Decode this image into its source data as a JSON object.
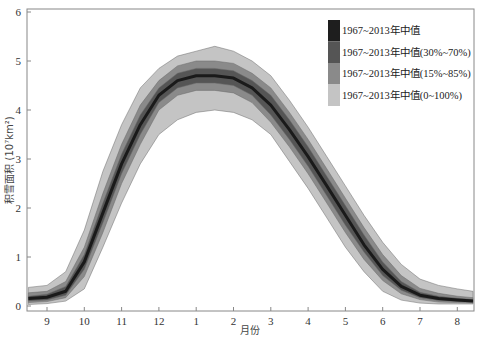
{
  "chart_data": {
    "type": "area",
    "title": "",
    "xlabel": "月份",
    "ylabel": "积雪面积 (10⁷km²)",
    "ylim": [
      0,
      6
    ],
    "xlim": [
      8.5,
      20.5
    ],
    "grid": false,
    "legend_position": "upper right (inside)",
    "x_ticks": [
      9,
      10,
      11,
      12,
      13,
      14,
      15,
      16,
      17,
      18,
      19,
      20
    ],
    "x_tick_labels": [
      "9",
      "10",
      "11",
      "12",
      "1",
      "2",
      "3",
      "4",
      "5",
      "6",
      "7",
      "8"
    ],
    "y_ticks": [
      0,
      1,
      2,
      3,
      4,
      5,
      6
    ],
    "y_tick_labels": [
      "0",
      "1",
      "2",
      "3",
      "4",
      "5",
      "6"
    ],
    "x": [
      8.5,
      9.0,
      9.5,
      10.0,
      10.5,
      11.0,
      11.5,
      12.0,
      12.5,
      13.0,
      13.5,
      14.0,
      14.5,
      15.0,
      15.5,
      16.0,
      16.5,
      17.0,
      17.5,
      18.0,
      18.5,
      19.0,
      19.5,
      20.0,
      20.5
    ],
    "series": [
      {
        "name": "1967~2013年中值",
        "type": "line",
        "color": "#1a1a1a",
        "values": [
          0.15,
          0.18,
          0.3,
          0.9,
          1.9,
          2.9,
          3.7,
          4.3,
          4.6,
          4.7,
          4.7,
          4.65,
          4.45,
          4.1,
          3.6,
          3.05,
          2.45,
          1.85,
          1.25,
          0.75,
          0.4,
          0.22,
          0.15,
          0.12,
          0.1
        ]
      },
      {
        "name": "1967~2013年中值(30%~70%)",
        "type": "band",
        "color": "#555555",
        "lower": [
          0.1,
          0.12,
          0.22,
          0.75,
          1.7,
          2.7,
          3.5,
          4.15,
          4.45,
          4.55,
          4.55,
          4.5,
          4.3,
          3.9,
          3.4,
          2.85,
          2.25,
          1.65,
          1.1,
          0.62,
          0.32,
          0.17,
          0.11,
          0.09,
          0.08
        ],
        "upper": [
          0.2,
          0.24,
          0.4,
          1.05,
          2.1,
          3.1,
          3.9,
          4.45,
          4.75,
          4.85,
          4.85,
          4.8,
          4.6,
          4.3,
          3.8,
          3.25,
          2.65,
          2.05,
          1.45,
          0.9,
          0.5,
          0.28,
          0.2,
          0.16,
          0.13
        ]
      },
      {
        "name": "1967~2013年中值(15%~85%)",
        "type": "band",
        "color": "#8a8a8a",
        "lower": [
          0.07,
          0.09,
          0.17,
          0.6,
          1.5,
          2.5,
          3.3,
          4.0,
          4.3,
          4.4,
          4.4,
          4.35,
          4.15,
          3.75,
          3.25,
          2.7,
          2.1,
          1.5,
          0.95,
          0.52,
          0.25,
          0.13,
          0.08,
          0.07,
          0.06
        ],
        "upper": [
          0.27,
          0.3,
          0.5,
          1.2,
          2.3,
          3.3,
          4.1,
          4.6,
          4.9,
          5.0,
          5.0,
          4.95,
          4.75,
          4.45,
          3.95,
          3.4,
          2.8,
          2.2,
          1.6,
          1.05,
          0.62,
          0.36,
          0.26,
          0.2,
          0.17
        ]
      },
      {
        "name": "1967~2013年中值(0~100%)",
        "type": "band",
        "color": "#c4c4c4",
        "lower": [
          0.03,
          0.05,
          0.1,
          0.35,
          1.2,
          2.1,
          2.9,
          3.5,
          3.8,
          3.95,
          4.0,
          3.95,
          3.8,
          3.5,
          2.95,
          2.4,
          1.8,
          1.2,
          0.7,
          0.3,
          0.12,
          0.06,
          0.04,
          0.04,
          0.04
        ],
        "upper": [
          0.38,
          0.42,
          0.7,
          1.55,
          2.75,
          3.7,
          4.45,
          4.85,
          5.1,
          5.2,
          5.3,
          5.2,
          5.0,
          4.7,
          4.2,
          3.65,
          3.05,
          2.45,
          1.85,
          1.3,
          0.85,
          0.55,
          0.42,
          0.35,
          0.3
        ]
      }
    ]
  },
  "legend": {
    "items": [
      {
        "label": "1967~2013年中值",
        "color": "#1e1e1e"
      },
      {
        "label": "1967~2013年中值(30%~70%)",
        "color": "#555555"
      },
      {
        "label": "1967~2013年中值(15%~85%)",
        "color": "#8a8a8a"
      },
      {
        "label": "1967~2013年中值(0~100%)",
        "color": "#c4c4c4"
      }
    ]
  },
  "axes": {
    "xlabel": "月份",
    "ylabel": "积雪面积 (10⁷km²)",
    "frame_color": "#888888"
  }
}
